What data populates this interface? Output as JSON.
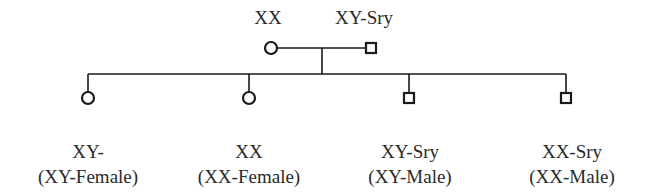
{
  "parents": {
    "mother": {
      "label": "XX",
      "symbol": "circle"
    },
    "father": {
      "label": "XY-Sry",
      "symbol": "square"
    }
  },
  "children": [
    {
      "genotype": "XY-",
      "phenotype": "(XY-Female)",
      "symbol": "circle"
    },
    {
      "genotype": "XX",
      "phenotype": "(XX-Female)",
      "symbol": "circle"
    },
    {
      "genotype": "XY-Sry",
      "phenotype": "(XY-Male)",
      "symbol": "square"
    },
    {
      "genotype": "XX-Sry",
      "phenotype": "(XX-Male)",
      "symbol": "square"
    }
  ],
  "colors": {
    "line": "#1a1a1a",
    "text": "#2a2a2a"
  }
}
